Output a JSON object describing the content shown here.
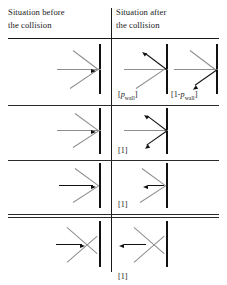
{
  "figure": {
    "type": "physics-collision-table"
  },
  "header": {
    "left": {
      "line1": "Situation before",
      "line2": "the collision"
    },
    "right": {
      "line1": "Situation after",
      "line2": "the collision"
    }
  },
  "columns": [
    {
      "key": "before",
      "title": "Situation before the collision"
    },
    {
      "key": "after",
      "title": "Situation after the collision"
    }
  ],
  "rows": [
    {
      "index": 1,
      "before": {
        "diagram": "incoming-arrow-fan-to-wall",
        "arrow_direction": "right-into-wall"
      },
      "after": [
        {
          "diagram": "reflected-arrow-up-left",
          "arrow_direction": "up-left",
          "label": "[p_wall]",
          "label_bracket_open": "[",
          "label_base": "p",
          "label_sub": "wall",
          "label_bracket_close": "]"
        },
        {
          "diagram": "reflected-arrow-down-left",
          "arrow_direction": "down-left",
          "label": "[1-p_wall]",
          "label_bracket_open": "[",
          "label_prefix": "1-",
          "label_base": "p",
          "label_sub": "wall",
          "label_bracket_close": "]"
        }
      ]
    },
    {
      "index": 2,
      "before": {
        "diagram": "incoming-arrow-fan-to-wall",
        "arrow_direction": "right-into-wall"
      },
      "after": [
        {
          "diagram": "two-arrows-up-right-and-down-left",
          "arrow_direction": "split",
          "label": "[1]",
          "label_bracket_open": "[",
          "label_base": "1",
          "label_bracket_close": "]"
        }
      ]
    },
    {
      "index": 3,
      "before": {
        "diagram": "short-arrow-right-to-wall",
        "arrow_direction": "right-into-wall"
      },
      "after": [
        {
          "diagram": "short-arrow-left-from-wall",
          "arrow_direction": "left-away-from-wall",
          "label": "[1]",
          "label_bracket_open": "[",
          "label_base": "1",
          "label_bracket_close": "]"
        }
      ]
    },
    {
      "index": 4,
      "before": {
        "diagram": "arrow-right-through-crossing-to-wall",
        "arrow_direction": "right-into-wall"
      },
      "after": [
        {
          "diagram": "arrow-left-through-crossing-from-wall",
          "arrow_direction": "left-away-from-wall",
          "label": "[1]",
          "label_bracket_open": "[",
          "label_base": "1",
          "label_bracket_close": "]"
        }
      ]
    }
  ],
  "labels": {
    "p_wall": {
      "open": "[",
      "prefix": "",
      "base": "p",
      "sub": "wall",
      "close": "]"
    },
    "one_minus_p_wall": {
      "open": "[",
      "prefix": "1-",
      "base": "p",
      "sub": "wall",
      "close": "]"
    },
    "one": {
      "open": "[",
      "prefix": "",
      "base": "1",
      "sub": "",
      "close": "]"
    }
  },
  "colors": {
    "ink": "#1a1a1a",
    "wall": "#111111",
    "construction_line": "#8d8d8d",
    "background": "#ffffff"
  }
}
